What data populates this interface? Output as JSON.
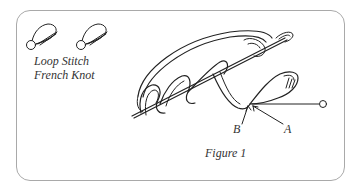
{
  "legend": {
    "items": [
      {
        "label": "Loop Stitch",
        "icon": "loop-stitch-icon"
      },
      {
        "label": "French Knot",
        "icon": "french-knot-icon"
      }
    ]
  },
  "figure": {
    "caption": "Figure 1",
    "points": [
      {
        "label": "B"
      },
      {
        "label": "A"
      }
    ]
  },
  "colors": {
    "line": "#222222",
    "frame": "#a9a9a9",
    "text": "#333333"
  }
}
